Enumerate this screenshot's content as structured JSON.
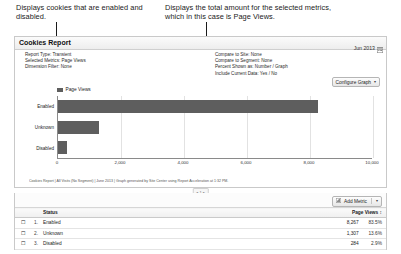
{
  "annotations": {
    "left": "Displays cookies that are enabled and disabled.",
    "right": "Displays the total amount for the selected metrics, which in this case is Page Views."
  },
  "report": {
    "title": "Cookies Report",
    "date_range": "Jun 2013",
    "calendar_icon": "calendar-icon",
    "meta_left": [
      {
        "label": "Report Type: Transient",
        "value": "Ranked"
      },
      {
        "label": "Selected Metrics: Page Views",
        "value": ""
      },
      {
        "label": "Dimension Filter: None",
        "value": ""
      }
    ],
    "meta_right": [
      {
        "label": "Compare to Site: None",
        "value": ""
      },
      {
        "label": "Compare to Segment: None",
        "value": ""
      },
      {
        "label": "Percent Shown as: Number / Graph",
        "value": ""
      },
      {
        "label": "Include Current Data: Yes / No",
        "value": ""
      }
    ],
    "configure_graph_label": "Configure Graph",
    "caret_glyph": "▾",
    "footnote": "Cookies Report | All Visits (No Segment) | June 2013 | Graph generated by Site Center using Report Acceleration at 1:32 PM."
  },
  "chart_data": {
    "type": "bar",
    "orientation": "horizontal",
    "title": "",
    "xlabel": "",
    "ylabel": "",
    "legend": [
      "Page Views"
    ],
    "legend_position": "top-left",
    "grid": true,
    "categories": [
      "Enabled",
      "Unknown",
      "Disabled"
    ],
    "values": [
      8267,
      1307,
      284
    ],
    "series": [
      {
        "name": "Page Views",
        "values": [
          8267,
          1307,
          284
        ],
        "color": "#5e5e5e"
      }
    ],
    "xlim": [
      0,
      10000
    ],
    "xticks": [
      0,
      2000,
      4000,
      6000,
      8000,
      10000
    ],
    "xtick_labels": [
      "0",
      "2,000",
      "4,000",
      "6,000",
      "8,000",
      "10,000"
    ]
  },
  "pager": {
    "label": "◂ 1 ▸"
  },
  "table": {
    "add_metric_label": "Add Metric",
    "add_metric_icon": "metric-icon",
    "caret_glyph": "▾",
    "columns": [
      "",
      "",
      "Status",
      "Page Views"
    ],
    "sort_glyph": "↕",
    "checkbox_glyph": "☐",
    "rows": [
      {
        "num": "1.",
        "status": "Enabled",
        "views": "8,267",
        "pct": "83.5%"
      },
      {
        "num": "2.",
        "status": "Unknown",
        "views": "1,307",
        "pct": "13.6%"
      },
      {
        "num": "3.",
        "status": "Disabled",
        "views": "284",
        "pct": "2.9%"
      }
    ]
  }
}
